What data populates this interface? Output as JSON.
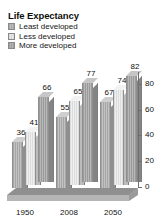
{
  "chart_data": {
    "type": "bar",
    "title": "Life Expectancy",
    "xlabel": "",
    "ylabel": "",
    "ylim": [
      0,
      90
    ],
    "yticks": [
      0,
      20,
      40,
      60,
      80
    ],
    "grid": false,
    "legend_position": "top-left",
    "style": "3d-grouped-column",
    "categories": [
      "1950",
      "2008",
      "2050"
    ],
    "series": [
      {
        "name": "Least developed",
        "values": [
          36,
          55,
          67
        ],
        "swatch_color": "#b0b0b0"
      },
      {
        "name": "Less developed",
        "values": [
          41,
          65,
          74
        ],
        "swatch_color": "#e2e2e2"
      },
      {
        "name": "More developed",
        "values": [
          66,
          77,
          82
        ],
        "swatch_color": "#a8a8a8"
      }
    ],
    "data_labels": [
      [
        "36",
        "41",
        "66"
      ],
      [
        "55",
        "65",
        "77"
      ],
      [
        "67",
        "74",
        "82"
      ]
    ]
  },
  "legend": {
    "items": [
      {
        "label": "Least developed"
      },
      {
        "label": "Less developed"
      },
      {
        "label": "More developed"
      }
    ]
  },
  "axis": {
    "y_tick_labels": [
      "80",
      "60",
      "40",
      "20",
      "0"
    ]
  },
  "x_axis": {
    "labels": [
      "1950",
      "2008",
      "2050"
    ]
  }
}
